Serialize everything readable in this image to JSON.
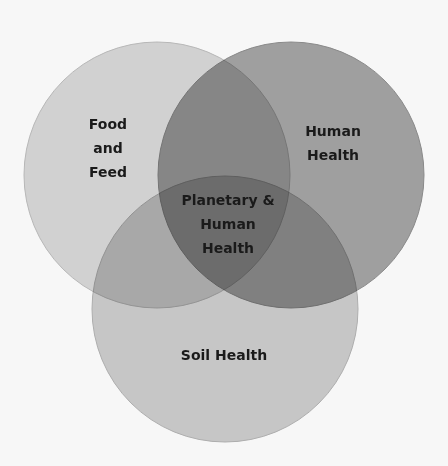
{
  "diagram": {
    "type": "venn",
    "sets": [
      {
        "id": "food-and-feed",
        "label_lines": [
          "Food",
          "and",
          "Feed"
        ],
        "fill": "#d8d8d8",
        "stroke": "#bdbdbd",
        "cx": 157,
        "cy": 175,
        "r": 133,
        "label_x": 108,
        "label_y": 112
      },
      {
        "id": "human-health",
        "label_lines": [
          "Human",
          "Health"
        ],
        "fill": "#a4a4a4",
        "stroke": "#8e8e8e",
        "cx": 291,
        "cy": 175,
        "r": 133,
        "label_x": 333,
        "label_y": 119
      },
      {
        "id": "soil-health",
        "label_lines": [
          "Soil Health"
        ],
        "fill": "#cdcdcd",
        "stroke": "#b3b3b3",
        "cx": 225,
        "cy": 309,
        "r": 133,
        "label_x": 224,
        "label_y": 343
      }
    ],
    "center": {
      "label_lines": [
        "Planetary &",
        "Human",
        "Health"
      ],
      "label_x": 228,
      "label_y": 188
    }
  }
}
